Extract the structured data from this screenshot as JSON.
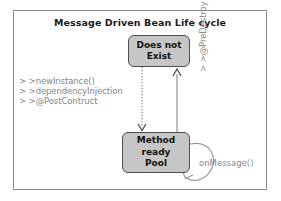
{
  "diagram": {
    "title": "Message Driven Bean Life cycle",
    "states": [
      {
        "id": "does-not-exist",
        "label_line1": "Does not",
        "label_line2": "Exist",
        "label_line3": ""
      },
      {
        "id": "method-ready-pool",
        "label_line1": "Method",
        "label_line2": "ready",
        "label_line3": "Pool"
      }
    ],
    "creation_steps": [
      "> >newInstance()",
      "> >dependencyInjection",
      "> >@PostContruct"
    ],
    "edges": {
      "predestroy_label": "> >@PreDestroy",
      "onmessage_label": "onMessage()"
    },
    "colors": {
      "box_fill": "#c6c6c6",
      "box_border": "#4d4d4d",
      "frame_border": "#8d8d8d",
      "label_gray": "#8a8a8a",
      "title_color": "#1a1a1a"
    }
  }
}
